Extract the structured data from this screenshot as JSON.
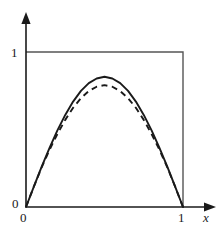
{
  "figure": {
    "kind": "math-plot",
    "background_color": "#ffffff",
    "stroke_color": "#1a1a1a",
    "frame_color": "#555555"
  },
  "labels": {
    "y_one": "1",
    "y_zero": "0",
    "x_zero": "0",
    "x_one": "1",
    "x_axis": "x"
  },
  "chart_data": {
    "type": "line",
    "title": "",
    "xlabel": "x",
    "ylabel": "",
    "xlim": [
      0,
      1
    ],
    "ylim": [
      0,
      1
    ],
    "grid": false,
    "legend": "none",
    "xticks": [
      0,
      1
    ],
    "xtick_labels": [
      "0",
      "1"
    ],
    "yticks": [
      0,
      1
    ],
    "ytick_labels": [
      "0",
      "1"
    ],
    "annotations": [
      "unit box frame drawn from (0,1) to (1,1) to (1,0)",
      "y-axis arrow points up, x-axis arrow points right"
    ],
    "series": [
      {
        "name": "solid-curve",
        "style": "solid",
        "color": "#1a1a1a",
        "x": [
          0.0,
          0.05,
          0.1,
          0.15,
          0.2,
          0.25,
          0.3,
          0.35,
          0.4,
          0.45,
          0.5,
          0.55,
          0.6,
          0.65,
          0.7,
          0.75,
          0.8,
          0.85,
          0.9,
          0.95,
          1.0
        ],
        "y": [
          0.0,
          0.131,
          0.26,
          0.381,
          0.494,
          0.594,
          0.68,
          0.749,
          0.799,
          0.829,
          0.84,
          0.829,
          0.799,
          0.749,
          0.68,
          0.594,
          0.494,
          0.381,
          0.26,
          0.131,
          0.0
        ]
      },
      {
        "name": "dashed-curve",
        "style": "dashed",
        "color": "#1a1a1a",
        "x": [
          0.0,
          0.05,
          0.1,
          0.15,
          0.2,
          0.25,
          0.3,
          0.35,
          0.4,
          0.45,
          0.5,
          0.55,
          0.6,
          0.65,
          0.7,
          0.75,
          0.8,
          0.85,
          0.9,
          0.95,
          1.0
        ],
        "y": [
          0.0,
          0.131,
          0.256,
          0.369,
          0.471,
          0.562,
          0.64,
          0.702,
          0.748,
          0.776,
          0.786,
          0.776,
          0.748,
          0.702,
          0.64,
          0.562,
          0.471,
          0.369,
          0.256,
          0.131,
          0.0
        ]
      }
    ]
  },
  "geometry": {
    "origin_px": [
      26,
      207
    ],
    "x_unit_px": 157,
    "y_unit_px": 155
  }
}
